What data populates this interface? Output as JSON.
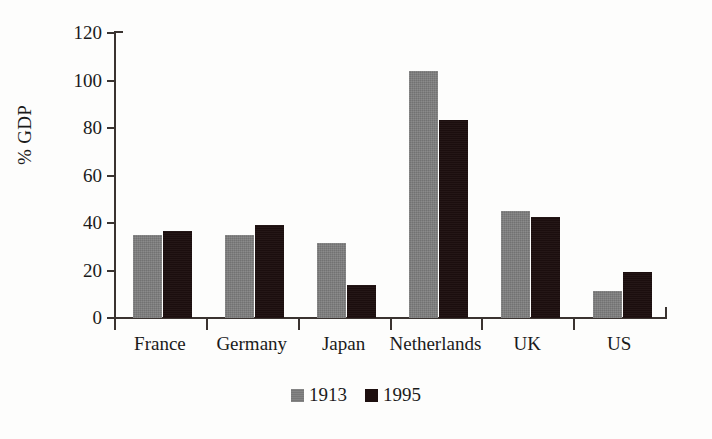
{
  "chart_data": {
    "type": "bar",
    "title": "",
    "xlabel": "",
    "ylabel": "% GDP",
    "ylim": [
      0,
      120
    ],
    "yticks": [
      0,
      20,
      40,
      60,
      80,
      100,
      120
    ],
    "ytick_labels": [
      "0",
      "20",
      "40",
      "60",
      "80",
      "100",
      "120"
    ],
    "grid": false,
    "legend_position": "bottom-center",
    "categories": [
      "France",
      "Germany",
      "Japan",
      "Netherlands",
      "UK",
      "US"
    ],
    "series": [
      {
        "name": "1913",
        "color": "#7d7d7d",
        "values": [
          35,
          35,
          31.5,
          104,
          45,
          11.5
        ]
      },
      {
        "name": "1995",
        "color": "#1d0f0f",
        "values": [
          36.5,
          39,
          14,
          83.5,
          42.5,
          19.5
        ]
      }
    ]
  },
  "axis": {
    "y_title": "% GDP"
  },
  "legend": {
    "items": [
      {
        "label": "1913"
      },
      {
        "label": "1995"
      }
    ]
  }
}
